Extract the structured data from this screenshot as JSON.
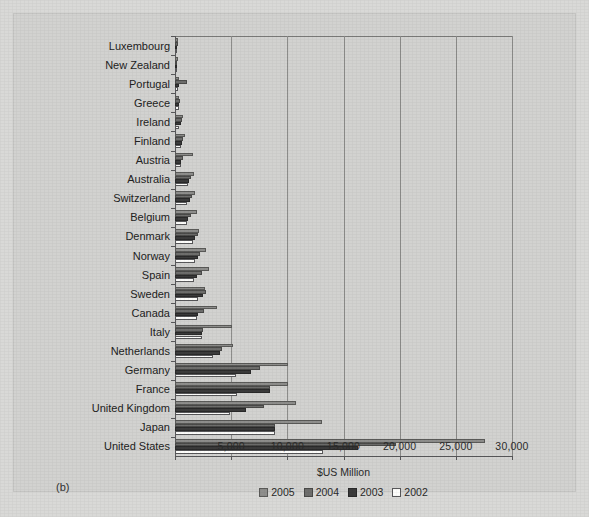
{
  "figure": {
    "panel_label": "(b)",
    "background_color": "#d9d9d7",
    "panel_color": "#d2d2d0"
  },
  "legend": {
    "position": "bottom-center",
    "entries": [
      {
        "label": "2005",
        "key": "s2005",
        "color": "#8e8e8c"
      },
      {
        "label": "2004",
        "key": "s2004",
        "color": "#6e6e6c"
      },
      {
        "label": "2003",
        "key": "s2003",
        "color": "#3b3b3b"
      },
      {
        "label": "2002",
        "key": "s2002",
        "color": "#fdfdfb"
      }
    ]
  },
  "chart_data": {
    "type": "bar",
    "orientation": "horizontal",
    "title": "",
    "subtitle": "",
    "xlabel": "$US Million",
    "ylabel": "",
    "xlim": [
      0,
      30000
    ],
    "xticks": [
      0,
      5000,
      10000,
      15000,
      20000,
      25000,
      30000
    ],
    "xticklabels": [
      "",
      "5,000",
      "10,000",
      "15,000",
      "20,000",
      "25,000",
      "30,000"
    ],
    "grid": "vertical",
    "legend_position": "bottom-center",
    "categories": [
      "Luxembourg",
      "New Zealand",
      "Portugal",
      "Greece",
      "Ireland",
      "Finland",
      "Austria",
      "Australia",
      "Switzerland",
      "Belgium",
      "Denmark",
      "Norway",
      "Spain",
      "Sweden",
      "Canada",
      "Italy",
      "Netherlands",
      "Germany",
      "France",
      "United Kingdom",
      "Japan",
      "United States"
    ],
    "series": [
      {
        "name": "2005",
        "color": "#8e8e8c",
        "values": [
          260,
          270,
          380,
          380,
          720,
          900,
          1570,
          1680,
          1770,
          1960,
          2110,
          2790,
          3020,
          2700,
          3760,
          5090,
          5120,
          10080,
          10030,
          10770,
          13130,
          27620
        ]
      },
      {
        "name": "2004",
        "color": "#6e6e6c",
        "values": [
          240,
          210,
          1040,
          460,
          610,
          690,
          680,
          1460,
          1550,
          1460,
          2040,
          2200,
          2440,
          2720,
          2600,
          2460,
          4200,
          7530,
          8470,
          7880,
          8920,
          19700
        ]
      },
      {
        "name": "2003",
        "color": "#3b3b3b",
        "values": [
          200,
          170,
          320,
          360,
          500,
          650,
          520,
          1240,
          1300,
          1200,
          1750,
          2040,
          1960,
          2520,
          2030,
          2430,
          3980,
          6790,
          8470,
          6280,
          8880,
          16250
        ]
      },
      {
        "name": "2002",
        "color": "#fdfdfb",
        "values": [
          150,
          130,
          260,
          350,
          400,
          520,
          490,
          1130,
          1050,
          1070,
          1620,
          1750,
          1700,
          2040,
          1930,
          2390,
          3340,
          5470,
          5480,
          4930,
          8880,
          13180
        ]
      }
    ]
  }
}
